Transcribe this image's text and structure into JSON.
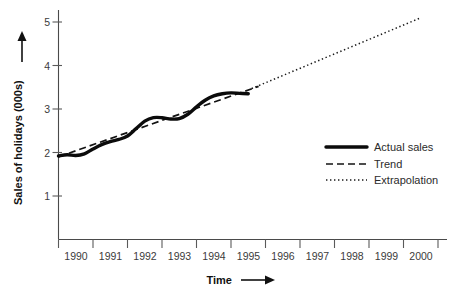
{
  "chart_data": {
    "type": "line",
    "title": "",
    "xlabel": "Time",
    "ylabel": "Sales of holidays (000s)",
    "xlim": [
      1990,
      2000.5
    ],
    "ylim": [
      0,
      5.4
    ],
    "yticks": [
      1,
      2,
      3,
      4,
      5
    ],
    "ytick_labels": [
      "1",
      "2",
      "3",
      "4",
      "5"
    ],
    "xticks": [
      1990,
      1991,
      1992,
      1993,
      1994,
      1995,
      1996,
      1997,
      1998,
      1999,
      2000
    ],
    "xtick_labels": [
      "1990",
      "1991",
      "1992",
      "1993",
      "1994",
      "1995",
      "1996",
      "1997",
      "1998",
      "1999",
      "2000"
    ],
    "grid": false,
    "legend_position": "center-right",
    "series": [
      {
        "name": "Actual sales",
        "style": "solid-thick",
        "x": [
          1990.0,
          1990.25,
          1990.5,
          1990.75,
          1991.0,
          1991.25,
          1991.5,
          1991.75,
          1992.0,
          1992.25,
          1992.5,
          1992.75,
          1993.0,
          1993.25,
          1993.5,
          1993.75,
          1994.0,
          1994.25,
          1994.5,
          1994.75,
          1995.0,
          1995.25,
          1995.5
        ],
        "values": [
          1.92,
          1.95,
          1.93,
          1.97,
          2.08,
          2.18,
          2.25,
          2.3,
          2.38,
          2.55,
          2.72,
          2.8,
          2.8,
          2.77,
          2.78,
          2.88,
          3.05,
          3.2,
          3.3,
          3.35,
          3.37,
          3.36,
          3.35
        ]
      },
      {
        "name": "Trend",
        "style": "dashed",
        "x": [
          1990.0,
          1995.8
        ],
        "values": [
          1.9,
          3.52
        ]
      },
      {
        "name": "Extrapolation",
        "style": "dotted",
        "x": [
          1995.6,
          2000.45
        ],
        "values": [
          3.47,
          5.08
        ]
      }
    ]
  },
  "legend": {
    "items": [
      {
        "label": "Actual sales",
        "style": "solid-thick"
      },
      {
        "label": "Trend",
        "style": "dashed"
      },
      {
        "label": "Extrapolation",
        "style": "dotted"
      }
    ]
  },
  "axes": {
    "y_axis_label": "Sales of holidays (000s)",
    "x_axis_label": "Time"
  }
}
